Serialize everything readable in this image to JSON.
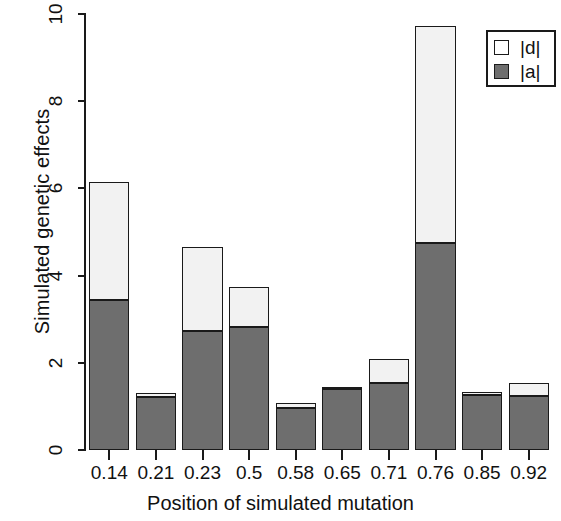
{
  "chart_data": {
    "type": "bar",
    "stacked": true,
    "title": "",
    "xlabel": "Position of simulated mutation",
    "ylabel": "Simulated genetic effects",
    "categories": [
      "0.14",
      "0.21",
      "0.23",
      "0.5",
      "0.58",
      "0.65",
      "0.71",
      "0.76",
      "0.85",
      "0.92"
    ],
    "series": [
      {
        "name": "|a|",
        "color": "#6e6e6e",
        "values": [
          3.44,
          1.22,
          2.73,
          2.82,
          0.96,
          1.4,
          1.54,
          4.75,
          1.26,
          1.25
        ]
      },
      {
        "name": "|d|",
        "color": "#f2f2f2",
        "values": [
          2.71,
          0.09,
          1.93,
          0.92,
          0.12,
          0.05,
          0.55,
          4.97,
          0.07,
          0.29
        ]
      }
    ],
    "totals": [
      6.15,
      1.31,
      4.66,
      3.74,
      1.08,
      1.45,
      2.09,
      9.72,
      1.33,
      1.54
    ],
    "ylim": [
      0,
      10
    ],
    "yticks": [
      "0",
      "2",
      "4",
      "6",
      "8",
      "10"
    ],
    "ytick_values": [
      0,
      2,
      4,
      6,
      8,
      10
    ],
    "grid": false,
    "legend_position": "top-right"
  },
  "legend": {
    "entries": [
      {
        "label": "|d|",
        "swatch": "white-square"
      },
      {
        "label": "|a|",
        "swatch": "gray-square"
      }
    ]
  }
}
